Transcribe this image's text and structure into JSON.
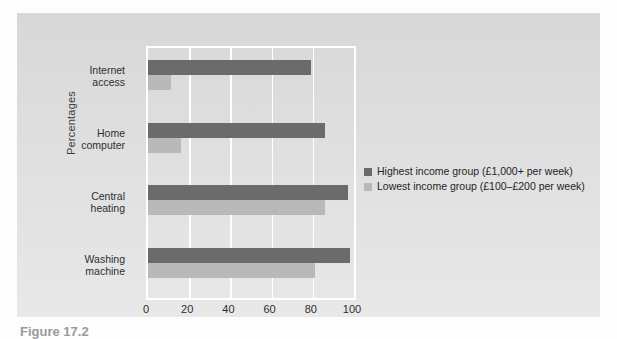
{
  "figure": {
    "y_axis_title": "Percentages",
    "caption_partial": "Figure 17.2"
  },
  "legend": {
    "position": "right",
    "entries": [
      {
        "label": "Highest income group (£1,000+ per week)",
        "color": "#6b6b6b",
        "swatch_name": "legend-swatch-highest"
      },
      {
        "label": "Lowest income group (£100–£200 per week)",
        "color": "#b9b9b9",
        "swatch_name": "legend-swatch-lowest"
      }
    ]
  },
  "artefacts": {
    "top_right": "­­­",
    "bottom_right_1": "­­",
    "bottom_right_2": "­­­"
  },
  "chart_data": {
    "type": "bar",
    "orientation": "horizontal",
    "title": "",
    "xlabel": "",
    "ylabel": "Percentages",
    "categories": [
      "Internet\naccess",
      "Home\ncomputer",
      "Central\nheating",
      "Washing\nmachine"
    ],
    "category_labels": [
      {
        "line1": "Internet",
        "line2": "access"
      },
      {
        "line1": "Home",
        "line2": "computer"
      },
      {
        "line1": "Central",
        "line2": "heating"
      },
      {
        "line1": "Washing",
        "line2": "machine"
      }
    ],
    "series": [
      {
        "name": "Highest income group (£1,000+ per week)",
        "color": "#6b6b6b",
        "values": [
          79,
          86,
          97,
          98
        ]
      },
      {
        "name": "Lowest income group (£100–£200 per week)",
        "color": "#b9b9b9",
        "values": [
          11,
          16,
          86,
          81
        ]
      }
    ],
    "xlim": [
      0,
      100
    ],
    "xticks": [
      0,
      20,
      40,
      60,
      80,
      100
    ],
    "xtick_labels": [
      "0",
      "20",
      "40",
      "60",
      "80",
      "100"
    ],
    "grid": true,
    "grid_color": "#ffffff",
    "plot_background": "#dcdcdc"
  }
}
